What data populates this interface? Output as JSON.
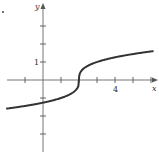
{
  "chart_data": {
    "type": "line",
    "title": "",
    "xlabel": "x",
    "ylabel": "y",
    "xlim": [
      -2,
      6.2
    ],
    "ylim": [
      -4,
      4.2
    ],
    "grid": false,
    "legend": null,
    "x_tick_values": [
      -1,
      0,
      1,
      2,
      3,
      4,
      5,
      6
    ],
    "y_tick_values": [
      -3,
      -2,
      -1,
      1,
      2,
      3
    ],
    "x_tick_labels": [
      {
        "value": 4,
        "label": "4"
      }
    ],
    "y_tick_labels": [
      {
        "value": 1,
        "label": "1"
      }
    ],
    "series": [
      {
        "name": "y = cbrt(x - 2)",
        "x": [
          -2,
          -1,
          0,
          1,
          1.5,
          1.9,
          2,
          2.1,
          2.5,
          3,
          4,
          5,
          6.1
        ],
        "y": [
          -1.59,
          -1.44,
          -1.26,
          -1.0,
          -0.79,
          -0.46,
          0,
          0.46,
          0.79,
          1.0,
          1.26,
          1.44,
          1.6
        ]
      }
    ],
    "annotations": [
      {
        "text": ".",
        "position": "top-left"
      }
    ]
  },
  "labels": {
    "x_axis": "x",
    "y_axis": "y",
    "y_tick_1": "1",
    "x_tick_4": "4"
  },
  "colors": {
    "axis": "#555555",
    "curve": "#333333"
  }
}
